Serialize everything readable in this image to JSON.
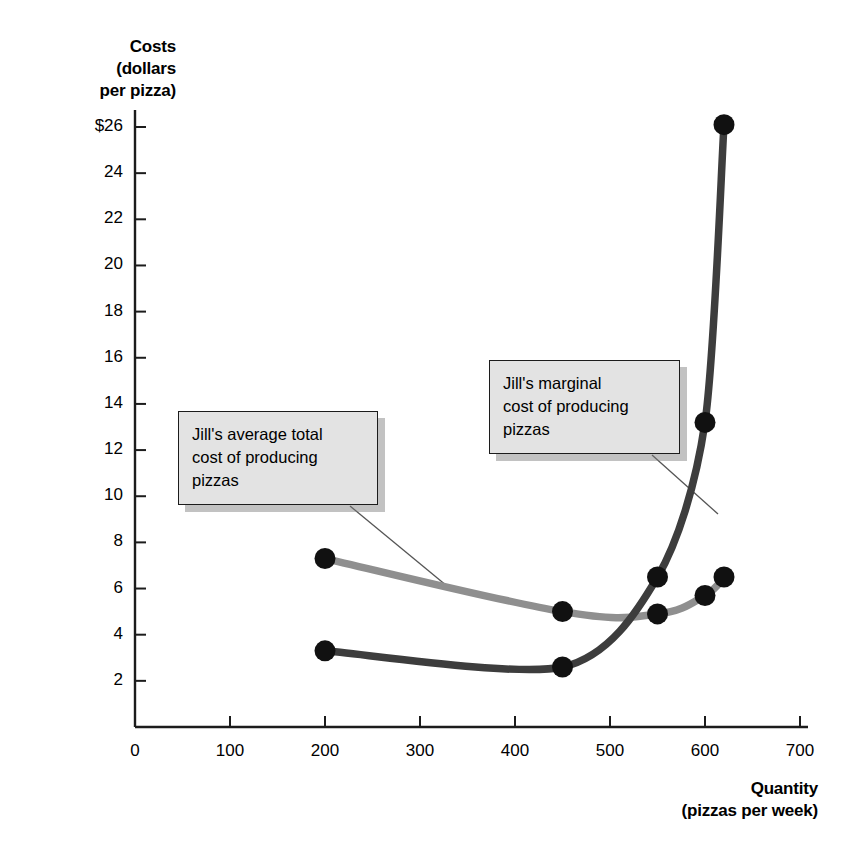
{
  "chart_data": {
    "type": "line",
    "title": "",
    "xlabel": "Quantity (pizzas per week)",
    "ylabel": "Costs (dollars per pizza)",
    "xlim": [
      0,
      700
    ],
    "ylim": [
      0,
      27
    ],
    "grid": false,
    "legend_position": "annotations",
    "x_ticks": [
      0,
      100,
      200,
      300,
      400,
      500,
      600,
      700
    ],
    "x_tick_labels": [
      "0",
      "100",
      "200",
      "300",
      "400",
      "500",
      "600",
      "700"
    ],
    "y_ticks": [
      2,
      4,
      6,
      8,
      10,
      12,
      14,
      16,
      18,
      20,
      22,
      24,
      26
    ],
    "y_tick_labels": [
      "2",
      "4",
      "6",
      "8",
      "10",
      "12",
      "14",
      "16",
      "18",
      "20",
      "22",
      "24",
      "$26"
    ],
    "series": [
      {
        "name": "Jill's marginal cost of producing pizzas",
        "color": "#3d3d3d",
        "x": [
          200,
          450,
          550,
          600,
          620
        ],
        "values": [
          3.3,
          2.6,
          6.5,
          13.2,
          26.1
        ]
      },
      {
        "name": "Jill's average total cost of producing pizzas",
        "color": "#8f8f8f",
        "x": [
          200,
          450,
          550,
          600,
          620
        ],
        "values": [
          7.3,
          5.0,
          4.9,
          5.7,
          6.5
        ]
      }
    ],
    "annotations": [
      {
        "id": "atc",
        "text": "Jill's average total\ncost of producing\npizzas",
        "points_to_series": "Jill's average total cost of producing pizzas"
      },
      {
        "id": "mc",
        "text": "Jill's marginal\ncost of producing\npizzas",
        "points_to_series": "Jill's marginal cost of producing pizzas"
      }
    ]
  },
  "axes": {
    "y_title_line1": "Costs",
    "y_title_line2": "(dollars",
    "y_title_line3": "per pizza)",
    "x_title_line1": "Quantity",
    "x_title_line2": "(pizzas per week)"
  },
  "colors": {
    "marginal_cost_curve": "#3d3d3d",
    "average_total_cost_curve": "#8f8f8f",
    "axis": "#1c1c1c",
    "callout_fill": "#e3e3e3",
    "callout_border": "#1c1c1c",
    "marker": "#111111",
    "background": "#ffffff"
  }
}
